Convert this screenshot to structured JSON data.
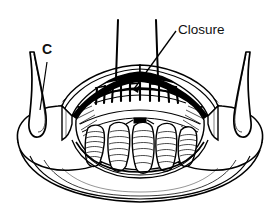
{
  "figure": {
    "type": "line-art-medical-diagram",
    "background_color": "#ffffff",
    "ink_color": "#000000",
    "width": 279,
    "height": 217
  },
  "labels": {
    "closure": {
      "text": "Closure",
      "x": 178,
      "y": 34,
      "anchor": "start"
    },
    "c": {
      "text": "C",
      "x": 42,
      "y": 54,
      "anchor": "start"
    }
  },
  "leaders": {
    "closure_leader": {
      "from_x": 176,
      "from_y": 31,
      "to_x": 133,
      "to_y": 90,
      "has_arrow": true
    },
    "c_leader": {
      "from_x": 47,
      "from_y": 60,
      "to_x": 39,
      "to_y": 110,
      "has_arrow": false
    }
  },
  "anatomy": {
    "suture_line": {
      "name": "suture-stitch-row",
      "stitch_count": 9,
      "start_x": 96,
      "end_x": 163,
      "y": 95
    },
    "lobes": {
      "name": "ribbed-lobes",
      "count": 5
    },
    "retractors": {
      "left": {
        "name": "left-retractor-hook"
      },
      "right": {
        "name": "right-retractor-hook"
      }
    },
    "threads": {
      "count": 2,
      "description": "vertical traction sutures"
    },
    "flaps": {
      "left": {
        "name": "left-tissue-flap"
      },
      "right": {
        "name": "right-tissue-flap"
      }
    }
  }
}
